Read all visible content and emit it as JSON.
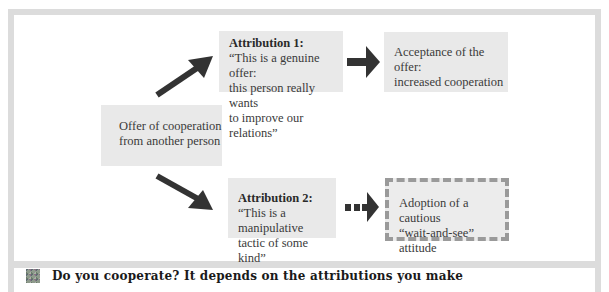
{
  "diagram": {
    "start_box": {
      "line1": "Offer of cooperation",
      "line2": "from another person"
    },
    "attribution1": {
      "title": "Attribution 1:",
      "line1": "“This is a genuine offer:",
      "line2": "this person really wants",
      "line3": "to improve our relations”"
    },
    "outcome1": {
      "line1": "Acceptance of the offer:",
      "line2": "increased cooperation"
    },
    "attribution2": {
      "title": "Attribution 2:",
      "line1": "“This is a manipulative",
      "line2": "tactic of some kind”"
    },
    "outcome2": {
      "line1": "Adoption of a cautious",
      "line2": "“wait-and-see” attitude"
    },
    "colors": {
      "arrow": "#333333",
      "box_fill": "#e9e9e9",
      "frame": "#dcdcdc",
      "dashed_border": "#9a9a9a"
    }
  },
  "caption": {
    "icon": "mosaic-icon",
    "text": "Do you cooperate? It depends on the attributions you make"
  }
}
